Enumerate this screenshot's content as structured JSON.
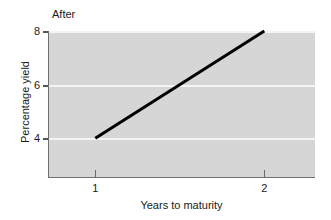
{
  "panel": {
    "label": "After"
  },
  "chart_data": {
    "type": "line",
    "title": "After",
    "xlabel": "Years to maturity",
    "ylabel": "Percentage yield",
    "xlim": [
      0.72,
      2.3
    ],
    "ylim": [
      2.55,
      8.0
    ],
    "xticks": [
      1,
      2
    ],
    "xticklabels": [
      "1",
      "2"
    ],
    "yticks": [
      4,
      6,
      8
    ],
    "yticklabels": [
      "4",
      "6",
      "8"
    ],
    "grid": "horizontal-white-gridlines-at-yticks",
    "legend": "none",
    "background": "#d6d6d6",
    "series": [
      {
        "name": "yield curve",
        "color": "#000000",
        "linewidth": 3,
        "x": [
          1,
          2
        ],
        "y": [
          4,
          8
        ]
      }
    ]
  },
  "colors": {
    "panel_background": "#d6d6d6",
    "gridline": "#f4f4f4",
    "series_line": "#000000",
    "axis": "#707070",
    "text": "#1a1a1a"
  }
}
